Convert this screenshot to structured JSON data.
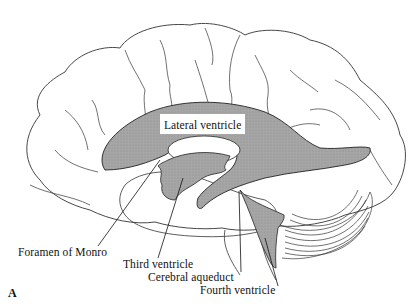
{
  "figure": {
    "panel_letter": "A",
    "colors": {
      "outline": "#333333",
      "ventricle_fill": "#a9a9a9",
      "background": "#ffffff",
      "label_box": "#ffffff"
    },
    "labels": {
      "lateral_ventricle": "Lateral ventricle",
      "foramen_of_monro": "Foramen of Monro",
      "third_ventricle": "Third ventricle",
      "cerebral_aqueduct": "Cerebral aqueduct",
      "fourth_ventricle": "Fourth ventricle"
    }
  }
}
